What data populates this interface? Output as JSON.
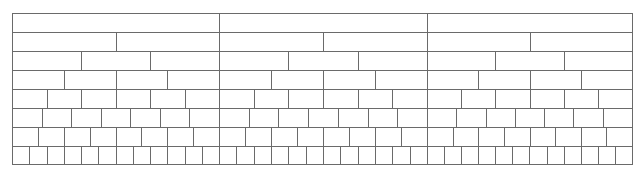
{
  "diagram": {
    "type": "fraction-wall",
    "line_color": "#6a6a6a",
    "background": "#ffffff",
    "walls": [
      {
        "name": "wall-1",
        "left": 0,
        "width": 207,
        "rows": [
          1,
          2,
          3,
          4,
          6,
          7,
          8,
          12
        ]
      },
      {
        "name": "wall-2",
        "left": 207,
        "width": 208,
        "rows": [
          1,
          2,
          3,
          4,
          6,
          7,
          8,
          12
        ]
      },
      {
        "name": "wall-3",
        "left": 415,
        "width": 206,
        "rows": [
          1,
          2,
          3,
          4,
          6,
          7,
          8,
          12
        ]
      }
    ],
    "row_height": 19
  }
}
